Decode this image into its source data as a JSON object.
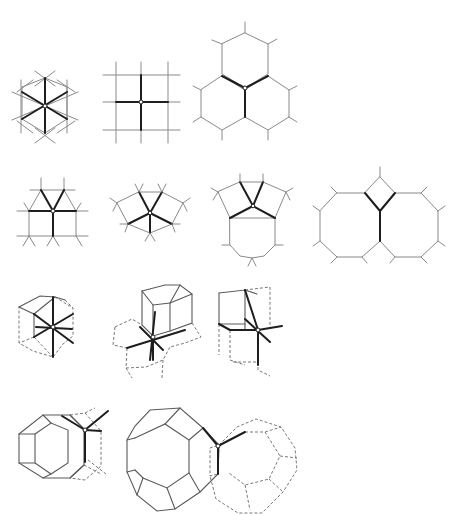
{
  "figure": {
    "rows": [
      {
        "row": 1,
        "panels": [
          "triangular-tiling-3.3.3.3.3.3",
          "square-tiling-4.4.4.4",
          "hexagonal-tiling-6.6.6"
        ]
      },
      {
        "row": 2,
        "panels": [
          "tiling-3.3.3.4.4",
          "tiling-3.3.4.3.4",
          "tiling-3.4.6.4",
          "tiling-4.8.8"
        ]
      },
      {
        "row": 3,
        "panels": [
          "rhombic-dodecahedra-packing",
          "hexagonal-prism-packing",
          "cube-packing"
        ]
      },
      {
        "row": 4,
        "panels": [
          "hexagonal-prism-vertex",
          "truncated-octahedra-packing"
        ]
      }
    ],
    "colors": {
      "line": "#8a8a8a",
      "bold_line": "#1e1e1e",
      "background": "#ffffff"
    }
  }
}
